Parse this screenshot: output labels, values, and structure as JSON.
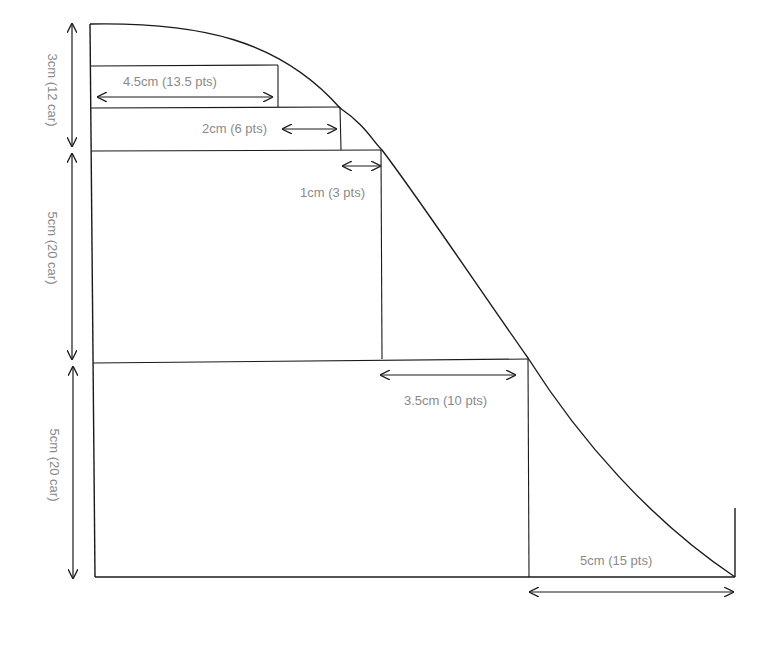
{
  "diagram": {
    "type": "shaping-curve-measurements",
    "vertical_labels": [
      {
        "id": "v1",
        "text": "3cm (12 car)"
      },
      {
        "id": "v2",
        "text": "5cm (20 car)"
      },
      {
        "id": "v3",
        "text": "5cm (20 car)"
      }
    ],
    "horizontal_labels": [
      {
        "id": "h1",
        "text": "4.5cm (13.5 pts)"
      },
      {
        "id": "h2",
        "text": "2cm (6 pts)"
      },
      {
        "id": "h3",
        "text": "1cm (3 pts)"
      },
      {
        "id": "h4",
        "text": "3.5cm (10 pts)"
      },
      {
        "id": "h5",
        "text": "5cm (15 pts)"
      }
    ],
    "colors": {
      "line": "#1a1a1a",
      "label": "#8a8a8a",
      "background": "#ffffff"
    }
  }
}
